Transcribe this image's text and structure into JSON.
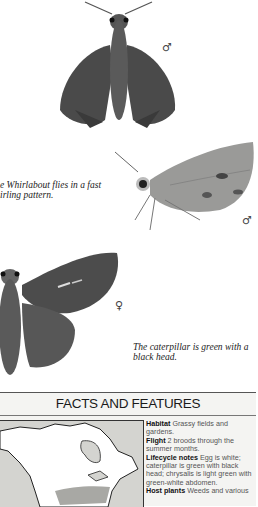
{
  "illustrations": [
    {
      "name": "whirlabout-male-dorsal",
      "sex_symbol": "♂"
    },
    {
      "name": "whirlabout-male-lateral",
      "sex_symbol": "♂"
    },
    {
      "name": "whirlabout-female-dorsal",
      "sex_symbol": "♀"
    }
  ],
  "captions": {
    "flight": [
      "e Whirlabout flies in a fast",
      "irling pattern."
    ],
    "caterpillar": [
      "The caterpillar is green with a",
      "black head."
    ]
  },
  "facts": {
    "title": "FACTS AND FEATURES",
    "items": [
      {
        "label": "Habitat",
        "text": "Grassy fields and gardens."
      },
      {
        "label": "Flight",
        "text": "2 broods through the summer months."
      },
      {
        "label": "Lifecycle notes",
        "text": "Egg is white; caterpillar is green with black head; chrysalis is light green with green-white abdomen."
      },
      {
        "label": "Host plants",
        "text": "Weeds and various"
      }
    ]
  },
  "map": {
    "land_color": "#ffffff",
    "water_color": "#d4d4d0",
    "range_color": "#a8a8a4"
  }
}
